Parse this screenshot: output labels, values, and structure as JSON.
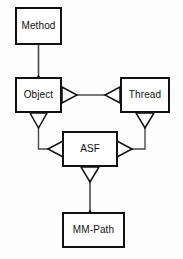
{
  "diagram": {
    "kind": "uml-class-diagram",
    "canvas": {
      "width": 183,
      "height": 259
    },
    "style": {
      "background_color": "#fdfdfd",
      "box_fill_color": "#ffffff",
      "border_color": "#111111",
      "line_color": "#4a4a4a",
      "text_color": "#111111",
      "arrowhead_shape": "hollow-triangle"
    },
    "nodes": [
      {
        "id": "method",
        "label": "Method",
        "x": 15,
        "y": 7,
        "width": 47,
        "height": 38
      },
      {
        "id": "object",
        "label": "Object",
        "x": 15,
        "y": 77,
        "width": 47,
        "height": 36
      },
      {
        "id": "thread",
        "label": "Thread",
        "x": 120,
        "y": 77,
        "width": 50,
        "height": 36
      },
      {
        "id": "asf",
        "label": "ASF",
        "x": 62,
        "y": 131,
        "width": 56,
        "height": 36
      },
      {
        "id": "mm_path",
        "label": "MM-Path",
        "x": 62,
        "y": 212,
        "width": 63,
        "height": 36
      }
    ],
    "edges": [
      {
        "id": "method-to-object",
        "from": "method",
        "to": "object",
        "arrowhead_at": "object-top",
        "direction": "down"
      },
      {
        "id": "object-to-thread",
        "from": "object",
        "to": "thread",
        "arrowhead_at": "object-right-and-thread-left",
        "direction": "horizontal"
      },
      {
        "id": "object-to-asf",
        "from": "object",
        "to": "asf",
        "arrowhead_at": "object-bottom-and-asf-left",
        "direction": "down-then-right"
      },
      {
        "id": "thread-to-asf",
        "from": "thread",
        "to": "asf",
        "arrowhead_at": "thread-bottom-and-asf-right",
        "direction": "down-then-left"
      },
      {
        "id": "asf-to-mm-path",
        "from": "asf",
        "to": "mm_path",
        "arrowhead_at": "asf-bottom-and-mm-path-top",
        "direction": "down"
      }
    ]
  }
}
